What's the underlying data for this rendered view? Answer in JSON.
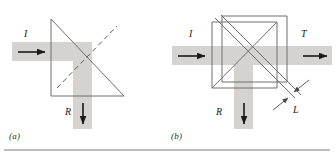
{
  "figure": {
    "type": "optics-diagram",
    "panels": [
      {
        "id": "a",
        "caption": "(a)",
        "optic": "right-angle-prism",
        "beams": [
          {
            "name": "incident",
            "label": "I",
            "direction": "right"
          },
          {
            "name": "reflected",
            "label": "R",
            "direction": "down"
          }
        ],
        "dashed_line": "normal-axis"
      },
      {
        "id": "b",
        "caption": "(b)",
        "optic": "cube-beamsplitter-with-gap",
        "beams": [
          {
            "name": "incident",
            "label": "I",
            "direction": "right"
          },
          {
            "name": "transmitted",
            "label": "T",
            "direction": "right"
          },
          {
            "name": "reflected",
            "label": "R",
            "direction": "down"
          }
        ],
        "dimension": {
          "label": "L",
          "meaning": "air gap thickness"
        }
      }
    ],
    "colors": {
      "beam": "#d4d3d1",
      "outline": "#6e6e6e",
      "ink": "#231f20",
      "rule": "#a9a9a9",
      "background": "#ffffff"
    }
  }
}
